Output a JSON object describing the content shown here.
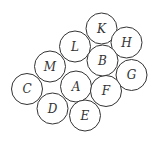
{
  "diagram": {
    "title": "",
    "stroke_color": "#333333",
    "fill_color": "#ffffff",
    "radius": 15.5,
    "circles": [
      {
        "label": "K",
        "cx": 101.5,
        "cy": 28.5
      },
      {
        "label": "H",
        "cx": 126.5,
        "cy": 42.5
      },
      {
        "label": "L",
        "cx": 75,
        "cy": 46.5
      },
      {
        "label": "B",
        "cx": 102.5,
        "cy": 60.5
      },
      {
        "label": "G",
        "cx": 131.5,
        "cy": 75
      },
      {
        "label": "M",
        "cx": 50,
        "cy": 66.5
      },
      {
        "label": "A",
        "cx": 76,
        "cy": 86.5
      },
      {
        "label": "F",
        "cx": 106,
        "cy": 91
      },
      {
        "label": "C",
        "cx": 27,
        "cy": 89
      },
      {
        "label": "D",
        "cx": 52.5,
        "cy": 108.5
      },
      {
        "label": "E",
        "cx": 85,
        "cy": 115.5
      }
    ]
  }
}
